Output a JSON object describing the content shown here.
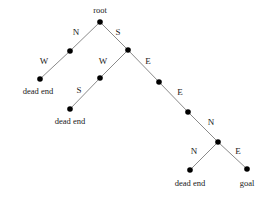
{
  "diagram": {
    "type": "search-tree",
    "title": "",
    "colors": {
      "node_fill": "#000000",
      "edge_stroke": "#8a8a8a",
      "text": "#1a1a1a",
      "background": "#ffffff"
    },
    "nodes": [
      {
        "id": "root",
        "x": 100,
        "y": 22,
        "r": 2.8,
        "label": "root",
        "label_x": 100,
        "label_y": 11,
        "label_class": "node-label"
      },
      {
        "id": "n_n",
        "x": 70,
        "y": 51,
        "r": 2.8,
        "label": "",
        "label_x": 0,
        "label_y": 0,
        "label_class": "node-label"
      },
      {
        "id": "n_nw",
        "x": 40,
        "y": 79,
        "r": 2.8,
        "label": "dead end",
        "label_x": 38,
        "label_y": 92,
        "label_class": "node-label"
      },
      {
        "id": "n_s",
        "x": 128,
        "y": 50,
        "r": 2.8,
        "label": "",
        "label_x": 0,
        "label_y": 0,
        "label_class": "node-label"
      },
      {
        "id": "n_sw",
        "x": 100,
        "y": 78,
        "r": 2.8,
        "label": "",
        "label_x": 0,
        "label_y": 0,
        "label_class": "node-label"
      },
      {
        "id": "n_sws",
        "x": 70,
        "y": 109,
        "r": 2.8,
        "label": "dead end",
        "label_x": 70,
        "label_y": 122,
        "label_class": "node-label"
      },
      {
        "id": "n_se",
        "x": 159,
        "y": 82,
        "r": 2.8,
        "label": "",
        "label_x": 0,
        "label_y": 0,
        "label_class": "node-label"
      },
      {
        "id": "n_see",
        "x": 188,
        "y": 112,
        "r": 2.8,
        "label": "",
        "label_x": 0,
        "label_y": 0,
        "label_class": "node-label"
      },
      {
        "id": "n_seen",
        "x": 218,
        "y": 142,
        "r": 2.8,
        "label": "",
        "label_x": 0,
        "label_y": 0,
        "label_class": "node-label"
      },
      {
        "id": "n_seenn",
        "x": 190,
        "y": 170,
        "r": 2.8,
        "label": "dead end",
        "label_x": 190,
        "label_y": 184,
        "label_class": "node-label"
      },
      {
        "id": "n_seene",
        "x": 247,
        "y": 169,
        "r": 2.8,
        "label": "goal",
        "label_x": 247,
        "label_y": 184,
        "label_class": "node-label"
      }
    ],
    "edges": [
      {
        "from": "root",
        "to": "n_n",
        "x1": 100,
        "y1": 22,
        "x2": 70,
        "y2": 51,
        "label": "N",
        "label_x": 76,
        "label_y": 33
      },
      {
        "from": "root",
        "to": "n_s",
        "x1": 100,
        "y1": 22,
        "x2": 128,
        "y2": 50,
        "label": "S",
        "label_x": 118,
        "label_y": 33
      },
      {
        "from": "n_n",
        "to": "n_nw",
        "x1": 70,
        "y1": 51,
        "x2": 40,
        "y2": 79,
        "label": "W",
        "label_x": 44,
        "label_y": 62
      },
      {
        "from": "n_s",
        "to": "n_sw",
        "x1": 128,
        "y1": 50,
        "x2": 100,
        "y2": 78,
        "label": "W",
        "label_x": 103,
        "label_y": 62
      },
      {
        "from": "n_s",
        "to": "n_se",
        "x1": 128,
        "y1": 50,
        "x2": 159,
        "y2": 82,
        "label": "E",
        "label_x": 148,
        "label_y": 62
      },
      {
        "from": "n_sw",
        "to": "n_sws",
        "x1": 100,
        "y1": 78,
        "x2": 70,
        "y2": 109,
        "label": "S",
        "label_x": 79,
        "label_y": 91
      },
      {
        "from": "n_se",
        "to": "n_see",
        "x1": 159,
        "y1": 82,
        "x2": 188,
        "y2": 112,
        "label": "E",
        "label_x": 180,
        "label_y": 93
      },
      {
        "from": "n_see",
        "to": "n_seen",
        "x1": 188,
        "y1": 112,
        "x2": 218,
        "y2": 142,
        "label": "N",
        "label_x": 211,
        "label_y": 123
      },
      {
        "from": "n_seen",
        "to": "n_seenn",
        "x1": 218,
        "y1": 142,
        "x2": 190,
        "y2": 170,
        "label": "N",
        "label_x": 194,
        "label_y": 152
      },
      {
        "from": "n_seen",
        "to": "n_seene",
        "x1": 218,
        "y1": 142,
        "x2": 247,
        "y2": 169,
        "label": "E",
        "label_x": 238,
        "label_y": 152
      }
    ]
  }
}
